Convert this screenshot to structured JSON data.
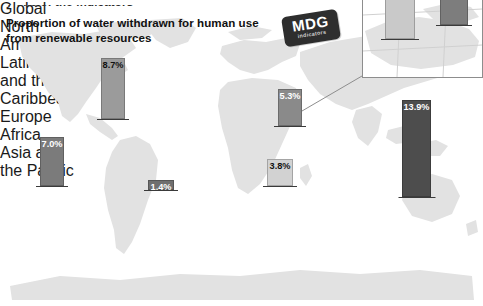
{
  "page": {
    "cut_off_header": "y one of the indicators",
    "title": "Proportion of water withdrawn for human use from renewable resources"
  },
  "logo": {
    "name": "mdg-logo",
    "line1": "MDG",
    "line2": "indicators"
  },
  "chart_data": {
    "type": "bar",
    "title": "Proportion of water withdrawn for human use from renewable resources",
    "xlabel": "",
    "ylabel": "",
    "unit": "%",
    "grid": false,
    "legend": "none",
    "categories": [
      "Global",
      "North America",
      "Latin America and the Caribbean",
      "Europe",
      "Africa",
      "Asia and the Pacific",
      "Northern Africa",
      "Mashriq"
    ],
    "values": [
      7.0,
      8.7,
      1.4,
      5.3,
      3.8,
      13.9,
      78.4,
      95.0
    ],
    "labels": [
      "7.0%",
      "8.7%",
      "1.4%",
      "5.3%",
      "3.8%",
      "13.9%",
      "78.4%",
      ""
    ],
    "bars": [
      {
        "id": "global",
        "label": "Global",
        "caption": "Global",
        "value_label": "7.0%",
        "value": 7.0,
        "color": "#7b7b7b",
        "value_text_color": "#ffffff",
        "x": 40,
        "width": 24,
        "bottom": 120,
        "height": 49,
        "in_inset": false
      },
      {
        "id": "north-america",
        "label": "North America",
        "caption": "North\nAmerica",
        "value_label": "8.7%",
        "value": 8.7,
        "color": "#9b9b9b",
        "value_text_color": "#111111",
        "x": 101,
        "width": 24,
        "bottom": 187,
        "height": 61,
        "in_inset": false
      },
      {
        "id": "latin-america",
        "label": "Latin America and the Caribbean",
        "caption": "Latin America\nand the\nCaribbean",
        "value_label": "1.4%",
        "value": 1.4,
        "color": "#6f6f6f",
        "value_text_color": "#ffffff",
        "x": 148,
        "width": 26,
        "bottom": 116,
        "height": 10,
        "in_inset": false
      },
      {
        "id": "europe",
        "label": "Europe",
        "caption": "Europe",
        "value_label": "5.3%",
        "value": 5.3,
        "color": "#8a8a8a",
        "value_text_color": "#ffffff",
        "x": 278,
        "width": 24,
        "bottom": 180,
        "height": 37,
        "in_inset": false
      },
      {
        "id": "africa",
        "label": "Africa",
        "caption": "Africa",
        "value_label": "3.8%",
        "value": 3.8,
        "color": "#d2d2d2",
        "value_text_color": "#111111",
        "x": 267,
        "width": 26,
        "bottom": 120,
        "height": 27,
        "in_inset": false
      },
      {
        "id": "asia-pacific",
        "label": "Asia and the Pacific",
        "caption": "Asia and\nthe Pacific",
        "value_label": "13.9%",
        "value": 13.9,
        "color": "#4d4d4d",
        "value_text_color": "#ffffff",
        "x": 402,
        "width": 29,
        "bottom": 109,
        "height": 97,
        "in_inset": false
      },
      {
        "id": "northern-africa",
        "label": "Northern Africa",
        "caption": "Northern Africa",
        "value_label": "78.4%",
        "value": 78.4,
        "color": "#c9c9c9",
        "value_text_color": "#111111",
        "x": 22,
        "width": 30,
        "bottom": 38,
        "height": 54,
        "in_inset": true
      },
      {
        "id": "mashriq",
        "label": "Mashriq",
        "caption": "Mashriq",
        "value_label": "",
        "value": 95.0,
        "color": "#7d7d7d",
        "value_text_color": "#ffffff",
        "x": 77,
        "width": 28,
        "bottom": 52,
        "height": 74,
        "in_inset": true
      }
    ]
  },
  "colors": {
    "background": "#ffffff",
    "map_fill": "#e2e2e2",
    "inset_border": "#8d8d8d",
    "logo_plate": "#2e2e2e",
    "text": "#141414"
  }
}
